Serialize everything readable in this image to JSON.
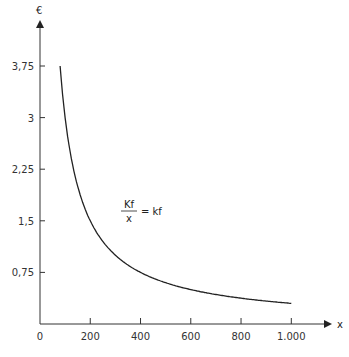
{
  "chart_data": {
    "type": "line",
    "title": "",
    "xlabel": "x",
    "ylabel": "€",
    "xlim": [
      0,
      1100
    ],
    "ylim": [
      0,
      4.2
    ],
    "x_ticks": [
      0,
      200,
      400,
      600,
      800,
      1000
    ],
    "x_tick_labels": [
      "0",
      "200",
      "400",
      "600",
      "800",
      "1.000"
    ],
    "y_ticks": [
      0.75,
      1.5,
      2.25,
      3,
      3.75
    ],
    "y_tick_labels": [
      "0,75",
      "1,5",
      "2,25",
      "3",
      "3,75"
    ],
    "grid": false,
    "series": [
      {
        "name": "kf = Kf / x",
        "function": "300 / x",
        "x": [
          80,
          100,
          150,
          200,
          250,
          300,
          400,
          500,
          600,
          700,
          800,
          900,
          1000
        ],
        "values": [
          3.75,
          3.0,
          2.0,
          1.5,
          1.2,
          1.0,
          0.75,
          0.6,
          0.5,
          0.43,
          0.375,
          0.33,
          0.3
        ]
      }
    ],
    "annotations": [
      {
        "text_numerator": "Kf",
        "text_denominator": "x",
        "text_rhs": "= kf",
        "x": 400,
        "y": 1.95
      }
    ]
  },
  "labels": {
    "y_axis_title": "€",
    "x_axis_title": "x",
    "origin": "0",
    "annot_num": "Kf",
    "annot_den": "x",
    "annot_rhs": "= kf"
  }
}
